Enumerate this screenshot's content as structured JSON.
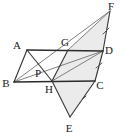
{
  "figure": {
    "background_color": "#ffffff",
    "line_color": "#3a3a3a",
    "fill_color": "#ebebeb",
    "label_color": "#1a1a1a",
    "points": [
      {
        "name": "A",
        "label": "A",
        "x": 27,
        "y": 50,
        "label_x": 17,
        "label_y": 49
      },
      {
        "name": "B",
        "label": "B",
        "x": 14,
        "y": 82,
        "label_x": 4,
        "label_y": 86
      },
      {
        "name": "C",
        "label": "C",
        "x": 95,
        "y": 81,
        "label_x": 98,
        "label_y": 88
      },
      {
        "name": "D",
        "label": "D",
        "x": 103,
        "y": 51,
        "label_x": 106,
        "label_y": 53
      },
      {
        "name": "E",
        "label": "E",
        "x": 70,
        "y": 117,
        "label_x": 66,
        "label_y": 131
      },
      {
        "name": "F",
        "label": "F",
        "x": 110,
        "y": 11,
        "label_x": 108,
        "label_y": 9
      },
      {
        "name": "G",
        "label": "G",
        "x": 68,
        "y": 50,
        "label_x": 62,
        "label_y": 45
      },
      {
        "name": "H",
        "label": "H",
        "x": 52,
        "y": 81,
        "label_x": 45,
        "label_y": 92
      },
      {
        "name": "P",
        "label": "P",
        "x": 43,
        "y": 74,
        "label_x": 36,
        "label_y": 75
      }
    ],
    "shaded_regions": [
      {
        "name": "quadrilateral-GDCH",
        "polygon": "68,50 103,51 95,81 52,81"
      },
      {
        "name": "triangle-GDF",
        "polygon": "68,50 103,51 110,11"
      },
      {
        "name": "triangle-HCE",
        "polygon": "52,81 95,81 70,117"
      }
    ],
    "segments": [
      {
        "name": "AB",
        "from": "A",
        "to": "B",
        "weight": "normal"
      },
      {
        "name": "AD",
        "from": "A",
        "to": "D",
        "weight": "bold"
      },
      {
        "name": "BC",
        "from": "B",
        "to": "C",
        "weight": "bold"
      },
      {
        "name": "BD",
        "from": "B",
        "to": "D",
        "weight": "thin"
      },
      {
        "name": "AH",
        "from": "A",
        "to": "H",
        "weight": "normal"
      },
      {
        "name": "BG",
        "from": "B",
        "to": "G",
        "weight": "thin"
      },
      {
        "name": "GH",
        "from": "G",
        "to": "H",
        "weight": "normal"
      },
      {
        "name": "GF",
        "from": "G",
        "to": "F",
        "weight": "thin"
      },
      {
        "name": "DF",
        "from": "D",
        "to": "F",
        "weight": "normal"
      },
      {
        "name": "HE",
        "from": "H",
        "to": "E",
        "weight": "normal"
      },
      {
        "name": "CE",
        "from": "C",
        "to": "E",
        "weight": "normal"
      },
      {
        "name": "DC",
        "from": "D",
        "to": "C",
        "weight": "normal"
      },
      {
        "name": "BF",
        "from": "B",
        "to": "F",
        "weight": "thin"
      },
      {
        "name": "HD",
        "from": "H",
        "to": "D",
        "weight": "thin"
      }
    ],
    "tick_marks": [
      {
        "name": "tick-on-DF",
        "x": 106,
        "y": 31,
        "angle": 62
      },
      {
        "name": "tick-on-DC",
        "x": 99,
        "y": 66,
        "angle": 75
      },
      {
        "name": "tick-on-CE",
        "x": 83,
        "y": 99,
        "angle": 56
      }
    ]
  }
}
